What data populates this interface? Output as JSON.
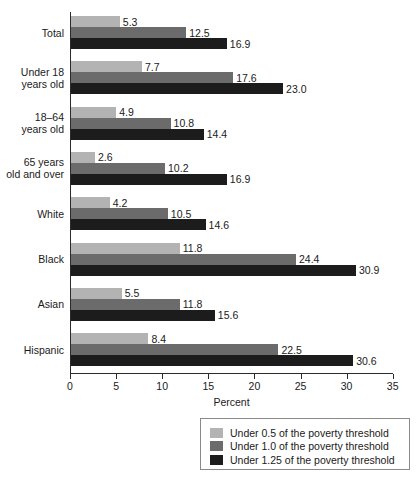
{
  "chart_data": {
    "type": "bar",
    "orientation": "horizontal",
    "title": "",
    "xlabel": "Percent",
    "ylabel": "",
    "xlim": [
      0,
      35
    ],
    "xticks": [
      0,
      5,
      10,
      15,
      20,
      25,
      30,
      35
    ],
    "xtick_labels": [
      "0",
      "5",
      "10",
      "15",
      "20",
      "25",
      "30",
      "35"
    ],
    "grid": false,
    "legend_position": "bottom-right",
    "categories": [
      "Total",
      "Under 18\nyears old",
      "18–64\nyears old",
      "65 years\nold and over",
      "White",
      "Black",
      "Asian",
      "Hispanic"
    ],
    "series": [
      {
        "name": "Under 0.5 of the poverty threshold",
        "color": "#b3b3b3",
        "values": [
          5.3,
          7.7,
          4.9,
          2.6,
          4.2,
          11.8,
          5.5,
          8.4
        ],
        "labels": [
          "5.3",
          "7.7",
          "4.9",
          "2.6",
          "4.2",
          "11.8",
          "5.5",
          "8.4"
        ]
      },
      {
        "name": "Under 1.0 of the poverty threshold",
        "color": "#6b6b6b",
        "values": [
          12.5,
          17.6,
          10.8,
          10.2,
          10.5,
          24.4,
          11.8,
          22.5
        ],
        "labels": [
          "12.5",
          "17.6",
          "10.8",
          "10.2",
          "10.5",
          "24.4",
          "11.8",
          "22.5"
        ]
      },
      {
        "name": "Under 1.25 of the poverty threshold",
        "color": "#1c1c1c",
        "values": [
          16.9,
          23.0,
          14.4,
          16.9,
          14.6,
          30.9,
          15.6,
          30.6
        ],
        "labels": [
          "16.9",
          "23.0",
          "14.4",
          "16.9",
          "14.6",
          "30.9",
          "15.6",
          "30.6"
        ]
      }
    ]
  },
  "legend": {
    "items": [
      {
        "label": "Under 0.5 of the poverty threshold",
        "color": "#b3b3b3"
      },
      {
        "label": "Under 1.0 of the poverty threshold",
        "color": "#6b6b6b"
      },
      {
        "label": "Under 1.25 of the poverty threshold",
        "color": "#1c1c1c"
      }
    ]
  },
  "axis": {
    "x_title": "Percent"
  }
}
